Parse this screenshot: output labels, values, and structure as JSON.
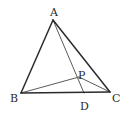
{
  "figure": {
    "background_color": "#ffffff",
    "stroke_color_outline": "#2b2b2b",
    "stroke_color_cevian": "#5a5a5a",
    "labels": {
      "a": "A",
      "b": "B",
      "c": "C",
      "d": "D",
      "p": "P"
    }
  },
  "chart_data": {
    "type": "diagram",
    "title": "",
    "coordinate_space": {
      "width": 124,
      "height": 117,
      "origin": "top-left",
      "units": "px"
    },
    "points": [
      {
        "name": "A",
        "x": 53,
        "y": 20,
        "label": "A",
        "label_x": 54,
        "label_y": 8,
        "role": "vertex"
      },
      {
        "name": "B",
        "x": 21,
        "y": 93,
        "label": "B",
        "label_x": 14,
        "label_y": 94,
        "role": "vertex"
      },
      {
        "name": "C",
        "x": 110,
        "y": 92,
        "label": "C",
        "label_x": 116,
        "label_y": 94,
        "role": "vertex"
      },
      {
        "name": "D",
        "x": 84,
        "y": 93,
        "label": "D",
        "label_x": 84,
        "label_y": 102,
        "role": "point-on-segment-bc"
      },
      {
        "name": "P",
        "x": 79,
        "y": 77,
        "label": "P",
        "label_x": 82,
        "label_y": 71,
        "role": "interior-point"
      }
    ],
    "segments": [
      {
        "name": "AB",
        "from": "A",
        "to": "B",
        "style": "outline"
      },
      {
        "name": "AC",
        "from": "A",
        "to": "C",
        "style": "outline"
      },
      {
        "name": "BC",
        "from": "B",
        "to": "C",
        "style": "outline"
      },
      {
        "name": "AD",
        "from": "A",
        "to": "D",
        "style": "cevian"
      },
      {
        "name": "BP",
        "from": "B",
        "to": "P",
        "style": "cevian"
      },
      {
        "name": "PC",
        "from": "P",
        "to": "C",
        "style": "cevian"
      }
    ],
    "grid": false,
    "legend": null,
    "xlabel": "",
    "ylabel": ""
  }
}
